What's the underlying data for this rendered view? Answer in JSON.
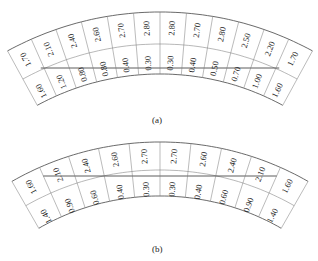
{
  "figures": [
    {
      "id": "a",
      "caption": "(a)",
      "upper_values": [
        "1.70",
        "2.10",
        "2.40",
        "2.60",
        "2.70",
        "2.80",
        "2.80",
        "2.70",
        "2.80",
        "2.50",
        "2.20",
        "1.70"
      ],
      "lower_values": [
        "1.60",
        "1.20",
        "0.80",
        "0.80",
        "0.40",
        "0.30",
        "0.30",
        "0.40",
        "0.50",
        "0.70",
        "1.00",
        "1.60"
      ]
    },
    {
      "id": "b",
      "caption": "(b)",
      "upper_values": [
        "1.60",
        "2.10",
        "2.40",
        "2.60",
        "2.70",
        "2.70",
        "2.60",
        "2.40",
        "2.10",
        "1.60"
      ],
      "lower_values": [
        "1.40",
        "0.90",
        "0.60",
        "0.40",
        "0.30",
        "0.30",
        "0.40",
        "0.60",
        "0.90",
        "1.40"
      ]
    }
  ],
  "colors": {
    "line": "#444444",
    "text": "#222222",
    "background": "#ffffff"
  }
}
